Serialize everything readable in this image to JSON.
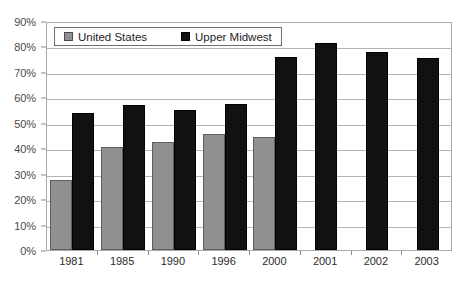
{
  "chart_data": {
    "type": "bar",
    "title": "",
    "xlabel": "",
    "ylabel": "",
    "ylim": [
      0,
      90
    ],
    "ytick_values": [
      0,
      10,
      20,
      30,
      40,
      50,
      60,
      70,
      80,
      90
    ],
    "ytick_labels": [
      "0%",
      "10%",
      "20%",
      "30%",
      "40%",
      "50%",
      "60%",
      "70%",
      "80%",
      "90%"
    ],
    "grid": true,
    "legend_position": "upper-left-inside",
    "categories": [
      "1981",
      "1985",
      "1990",
      "1996",
      "2000",
      "2001",
      "2002",
      "2003"
    ],
    "series": [
      {
        "name": "United States",
        "color": "#909090",
        "values": [
          27.5,
          40.5,
          42.5,
          45.5,
          44.5,
          null,
          null,
          null
        ]
      },
      {
        "name": "Upper Midwest",
        "color": "#111111",
        "values": [
          54.0,
          57.0,
          55.0,
          57.5,
          76.0,
          81.5,
          78.0,
          75.5
        ]
      }
    ]
  },
  "legend": {
    "items": [
      {
        "label": "United States",
        "swatch": "gray-square-icon"
      },
      {
        "label": "Upper Midwest",
        "swatch": "black-square-icon"
      }
    ]
  }
}
